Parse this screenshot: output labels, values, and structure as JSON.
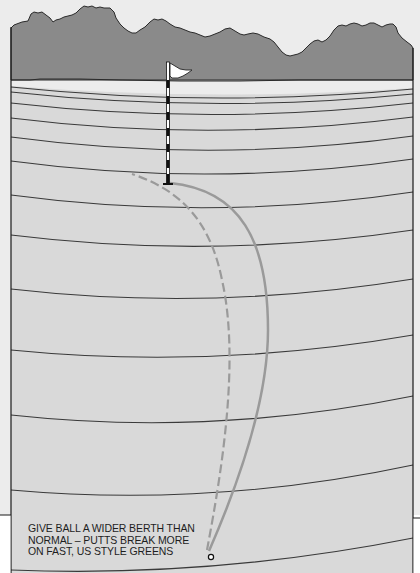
{
  "figure": {
    "caption_lines": [
      "GIVE BALL A WIDER BERTH THAN",
      "NORMAL – PUTTS BREAK MORE",
      "ON FAST, US STYLE GREENS"
    ],
    "elements": {
      "background_hills": "tree-line-silhouette",
      "green": "putting-green-with-contour-lines",
      "flagstick": "striped-flagstick-with-white-flag",
      "hole": "cup",
      "ball": "golf-ball",
      "path_solid": "actual-putt-line-wider-berth",
      "path_dashed": "normal-putt-line"
    },
    "colors": {
      "hills": "#8a8a8a",
      "green": "#d9d9d9",
      "far_green": "#ebebeb",
      "contour": "#3a3a3a",
      "putt_path": "#9a9a9a",
      "frame": "#1a1a1a",
      "outside": "#ececec"
    }
  }
}
